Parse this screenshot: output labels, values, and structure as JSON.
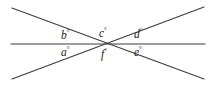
{
  "figure": {
    "type": "geometry-diagram",
    "background_color": "#ffffff",
    "line_color": "#3c3c3c",
    "label_color": "#242424",
    "degree_symbol": "°",
    "lines": [
      {
        "name": "horizontal-line",
        "x1": 11,
        "y1": 44,
        "x2": 205,
        "y2": 44
      },
      {
        "name": "diagonal-line-down-right",
        "x1": 12,
        "y1": 8,
        "x2": 204,
        "y2": 79
      },
      {
        "name": "diagonal-line-up-right",
        "x1": 12,
        "y1": 79,
        "x2": 204,
        "y2": 7
      }
    ],
    "intersection": {
      "name": "common-vertex",
      "x": 107,
      "y": 44
    },
    "labels": [
      {
        "id": "b",
        "text": "b",
        "degree": "°",
        "x": 61,
        "y": 29
      },
      {
        "id": "c",
        "text": "c",
        "degree": "°",
        "x": 99,
        "y": 27
      },
      {
        "id": "d",
        "text": "d",
        "degree": "°",
        "x": 134,
        "y": 28
      },
      {
        "id": "a",
        "text": "a",
        "degree": "°",
        "x": 61,
        "y": 46
      },
      {
        "id": "f",
        "text": "f",
        "degree": "°",
        "x": 101,
        "y": 48
      },
      {
        "id": "e",
        "text": "e",
        "degree": "°",
        "x": 134,
        "y": 46
      }
    ]
  }
}
